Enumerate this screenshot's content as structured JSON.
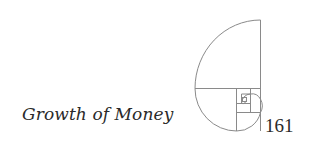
{
  "page": {
    "chapter_title": "Growth of Money",
    "page_number": "161"
  },
  "ornament": {
    "icon": "golden-spiral-icon",
    "stroke_color": "#8a8a8a"
  }
}
